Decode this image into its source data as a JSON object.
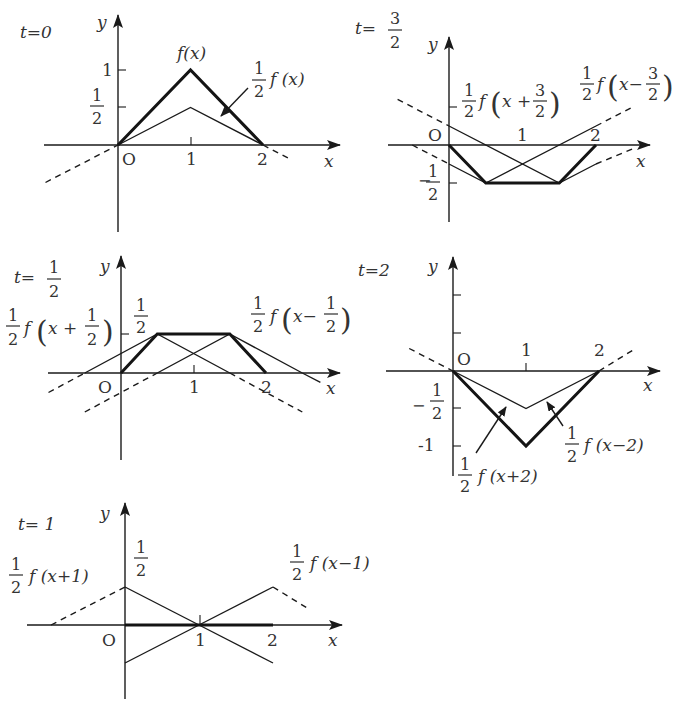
{
  "figure": {
    "color_ink": "#1a1a1a",
    "color_text": "#333333"
  },
  "panels": [
    {
      "id": "t0",
      "time_label": "t = 0",
      "time_text": "t=0",
      "axis_labels": {
        "x": "x",
        "y": "y",
        "origin": "O"
      },
      "x_ticks": [
        "1",
        "2"
      ],
      "y_ticks": [
        "1",
        "1/2"
      ],
      "curve_labels": [
        "f(x)",
        "1/2 f(x)"
      ],
      "origin_px": [
        118,
        145
      ],
      "ux": 72.5,
      "uy": 75,
      "x_range": [
        -1.0,
        3.0
      ],
      "y_range": [
        -1.2,
        1.7
      ],
      "thick": [
        [
          [
            0,
            0
          ],
          [
            1,
            1
          ],
          [
            2,
            0
          ]
        ]
      ],
      "thin": [
        [
          [
            0,
            0
          ],
          [
            1,
            0.5
          ],
          [
            2,
            0
          ]
        ]
      ],
      "dashed": [
        [
          [
            -1,
            -0.5
          ],
          [
            0,
            0
          ]
        ],
        [
          [
            2,
            0
          ],
          [
            2.4,
            -0.2
          ]
        ]
      ]
    },
    {
      "id": "t3_2",
      "time_label": "t = 3/2",
      "time_text": "t=",
      "time_frac": [
        "3",
        "2"
      ],
      "axis_labels": {
        "x": "x",
        "y": "y",
        "origin": "O"
      },
      "x_ticks": [
        "1",
        "2"
      ],
      "y_ticks": [
        "1/2",
        "-1/2"
      ],
      "curve_labels": [
        "1/2 f(x+3/2)",
        "1/2 f(x-3/2)"
      ],
      "origin_px": [
        449,
        145
      ],
      "ux": 73.5,
      "uy": 76,
      "x_range": [
        -1.0,
        2.6
      ],
      "y_range": [
        -1.2,
        1.4
      ],
      "thick": [
        [
          [
            0,
            0
          ],
          [
            0.5,
            -0.5
          ],
          [
            1.5,
            -0.5
          ],
          [
            2,
            0
          ]
        ]
      ],
      "thin": [
        [
          [
            0,
            0.25
          ],
          [
            1.5,
            -0.5
          ],
          [
            2,
            -0.25
          ]
        ],
        [
          [
            0,
            -0.25
          ],
          [
            0.5,
            -0.5
          ],
          [
            2,
            0.25
          ]
        ]
      ],
      "dashed": [
        [
          [
            -0.7,
            0.6
          ],
          [
            0,
            0.25
          ]
        ],
        [
          [
            -0.5,
            0
          ],
          [
            0,
            -0.25
          ]
        ],
        [
          [
            2,
            0.25
          ],
          [
            2.5,
            0.5
          ]
        ],
        [
          [
            2,
            -0.25
          ],
          [
            2.5,
            -0.05
          ]
        ]
      ]
    },
    {
      "id": "t1_2",
      "time_label": "t = 1/2",
      "time_text": "t=",
      "time_frac": [
        "1",
        "2"
      ],
      "axis_labels": {
        "x": "x",
        "y": "y",
        "origin": "O"
      },
      "x_ticks": [
        "1",
        "2"
      ],
      "y_ticks": [
        "1/2"
      ],
      "curve_labels": [
        "1/2 f(x+1/2)",
        "1/2 f(x-1/2)"
      ],
      "origin_px": [
        121,
        373
      ],
      "ux": 72.5,
      "uy": 78,
      "x_range": [
        -1.5,
        3.0
      ],
      "y_range": [
        -1.0,
        1.5
      ],
      "thick": [
        [
          [
            0,
            0
          ],
          [
            0.5,
            0.5
          ],
          [
            1.5,
            0.5
          ],
          [
            2,
            0
          ]
        ]
      ],
      "thin": [
        [
          [
            -0.5,
            0
          ],
          [
            0.5,
            0.5
          ],
          [
            1.5,
            0
          ]
        ],
        [
          [
            0.5,
            0
          ],
          [
            1.5,
            0.5
          ],
          [
            2.5,
            0
          ]
        ]
      ],
      "dashed": [
        [
          [
            -1.0,
            -0.25
          ],
          [
            -0.5,
            0
          ]
        ],
        [
          [
            -0.5,
            -0.5
          ],
          [
            0.5,
            0
          ]
        ],
        [
          [
            1.5,
            0
          ],
          [
            2.5,
            -0.5
          ]
        ]
      ],
      "extra_thin": [
        [
          [
            2.5,
            0
          ],
          [
            2.75,
            -0.12
          ]
        ]
      ]
    },
    {
      "id": "t2",
      "time_label": "t = 2",
      "time_text": "t=2",
      "axis_labels": {
        "x": "x",
        "y": "y",
        "origin": "O"
      },
      "x_ticks": [
        "1",
        "2"
      ],
      "y_ticks": [
        "-1/2",
        "-1"
      ],
      "curve_labels": [
        "1/2 f(x+2)",
        "1/2 f(x-2)"
      ],
      "origin_px": [
        453,
        371
      ],
      "ux": 73,
      "uy": 75,
      "x_range": [
        -1.0,
        2.6
      ],
      "y_range": [
        -1.4,
        1.5
      ],
      "thick": [
        [
          [
            0,
            0
          ],
          [
            1,
            -1
          ],
          [
            2,
            0
          ]
        ]
      ],
      "thin": [
        [
          [
            0,
            0
          ],
          [
            1,
            -0.5
          ],
          [
            2,
            0
          ]
        ]
      ],
      "dashed": [
        [
          [
            -0.6,
            0.3
          ],
          [
            0,
            0
          ]
        ],
        [
          [
            2,
            0
          ],
          [
            2.5,
            0.3
          ]
        ]
      ]
    },
    {
      "id": "t1",
      "time_label": "t = 1",
      "time_text": "t= 1",
      "axis_labels": {
        "x": "x",
        "y": "y",
        "origin": "O"
      },
      "x_ticks": [
        "1",
        "2"
      ],
      "y_ticks": [
        "1/2"
      ],
      "curve_labels": [
        "1/2 f(x+1)",
        "1/2 f(x-1)"
      ],
      "origin_px": [
        125,
        625
      ],
      "ux": 74,
      "uy": 76,
      "x_range": [
        -1.0,
        3.0
      ],
      "y_range": [
        -0.95,
        1.35
      ],
      "thick": [
        [
          [
            0,
            0
          ],
          [
            2,
            0
          ]
        ]
      ],
      "thin": [
        [
          [
            0,
            0.5
          ],
          [
            1,
            0
          ],
          [
            2,
            -0.5
          ]
        ],
        [
          [
            0,
            -0.5
          ],
          [
            1,
            0
          ],
          [
            2,
            0.5
          ]
        ]
      ],
      "dashed": [
        [
          [
            -1,
            0
          ],
          [
            0,
            0.5
          ]
        ],
        [
          [
            2,
            0.5
          ],
          [
            2.5,
            0.2
          ]
        ]
      ]
    }
  ]
}
